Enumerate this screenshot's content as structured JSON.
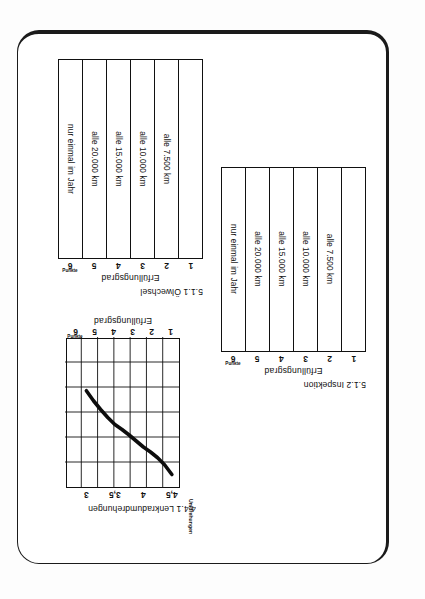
{
  "page": {
    "background": "#ffffff",
    "border_color": "#1b1b1b",
    "ink_color": "#111111"
  },
  "figures": [
    {
      "id": "oelwechsel",
      "caption": "5.1.1 Ölwechsel",
      "axis_title": "Erfüllungsgrad",
      "unit_note": "Punkte",
      "ticks": [
        "6",
        "5",
        "4",
        "3",
        "2",
        "1"
      ],
      "cells": [
        "nur einmal im Jahr",
        "alle 20.000 km",
        "alle 15.000 km",
        "alle 10.000 km",
        "alle  7.500 km",
        ""
      ]
    },
    {
      "id": "inspektion",
      "caption": "5.1.2 Inspektion",
      "axis_title": "Erfüllungsgrad",
      "unit_note": "Punkte",
      "ticks": [
        "6",
        "5",
        "4",
        "3",
        "2",
        "1"
      ],
      "cells": [
        "nur einmal im Jahr",
        "alle 20.000 km",
        "alle 15.000 km",
        "alle 10.000 km",
        "alle  7.500 km",
        ""
      ]
    }
  ],
  "line_figure": {
    "id": "lenkradumdrehungen",
    "caption": "4.4.1 Lenkradumdrehungen",
    "y_axis_title": "Erfüllungsgrad",
    "y_unit_note": "Punkte",
    "x_axis_title": "Umdrehungen",
    "y_ticks": [
      "6",
      "5",
      "4",
      "3",
      "2",
      "1"
    ],
    "x_ticks": [
      "3",
      "3,5",
      "4",
      "4,5"
    ]
  },
  "chart_data": {
    "type": "line",
    "title": "4.4.1 Lenkradumdrehungen",
    "xlabel": "Umdrehungen",
    "ylabel": "Erfüllungsgrad",
    "ylabel_unit": "Punkte",
    "xlim": [
      2.875,
      4.875
    ],
    "ylim": [
      0.5,
      6.5
    ],
    "xticks": [
      3,
      3.5,
      4,
      4.5
    ],
    "xticklabels": [
      "3",
      "3,5",
      "4",
      "4,5"
    ],
    "yticks": [
      6,
      5,
      4,
      3,
      2,
      1
    ],
    "yticklabels": [
      "6",
      "5",
      "4",
      "3",
      "2",
      "1"
    ],
    "grid": true,
    "legend": null,
    "series": [
      {
        "name": "Erfüllungsgrad",
        "x": [
          3.0,
          3.125,
          3.25,
          3.375,
          3.5,
          3.625,
          3.75,
          3.875,
          4.0,
          4.125,
          4.25,
          4.375,
          4.5
        ],
        "y": [
          6.0,
          5.62,
          5.33,
          5.1,
          4.9,
          4.66,
          4.42,
          4.2,
          4.0,
          3.72,
          3.4,
          3.05,
          2.65
        ]
      }
    ]
  },
  "secondary_charts": [
    {
      "type": "table",
      "title": "5.1.1 Ölwechsel",
      "ylabel": "Erfüllungsgrad",
      "ylabel_unit": "Punkte",
      "categories": [
        "6",
        "5",
        "4",
        "3",
        "2",
        "1"
      ],
      "values": [
        "nur einmal im Jahr",
        "alle 20.000 km",
        "alle 15.000 km",
        "alle 10.000 km",
        "alle  7.500 km",
        ""
      ]
    },
    {
      "type": "table",
      "title": "5.1.2 Inspektion",
      "ylabel": "Erfüllungsgrad",
      "ylabel_unit": "Punkte",
      "categories": [
        "6",
        "5",
        "4",
        "3",
        "2",
        "1"
      ],
      "values": [
        "nur einmal im Jahr",
        "alle 20.000 km",
        "alle 15.000 km",
        "alle 10.000 km",
        "alle  7.500 km",
        ""
      ]
    }
  ]
}
